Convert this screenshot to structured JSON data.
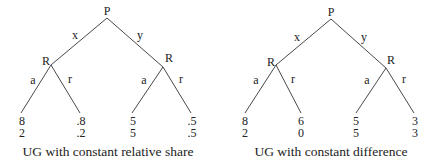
{
  "diagrams": [
    {
      "caption": "UG with constant relative share",
      "root": {
        "label": "P"
      },
      "edges_top": {
        "left": "x",
        "right": "y"
      },
      "left_node": {
        "label": "R",
        "edges": {
          "left": "a",
          "right": "r"
        }
      },
      "right_node": {
        "label": "R",
        "edges": {
          "left": "a",
          "right": "r"
        }
      },
      "payoffs": [
        {
          "p1": "8",
          "p2": "2"
        },
        {
          "p1": ".8",
          "p2": ".2"
        },
        {
          "p1": "5",
          "p2": "5"
        },
        {
          "p1": ".5",
          "p2": ".5"
        }
      ]
    },
    {
      "caption": "UG with constant difference",
      "root": {
        "label": "P"
      },
      "edges_top": {
        "left": "x",
        "right": "y"
      },
      "left_node": {
        "label": "R",
        "edges": {
          "left": "a",
          "right": "r"
        }
      },
      "right_node": {
        "label": "R",
        "edges": {
          "left": "a",
          "right": "r"
        }
      },
      "payoffs": [
        {
          "p1": "8",
          "p2": "2"
        },
        {
          "p1": "6",
          "p2": "0"
        },
        {
          "p1": "5",
          "p2": "5"
        },
        {
          "p1": "3",
          "p2": "3"
        }
      ]
    }
  ]
}
